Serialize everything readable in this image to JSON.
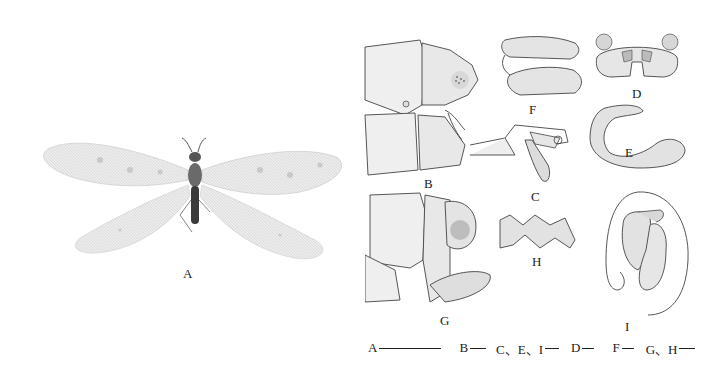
{
  "figure": {
    "panels": [
      {
        "id": "A",
        "label": "A",
        "description": "habitus, dorsal view (adult antlion with spread wings)"
      },
      {
        "id": "B",
        "label": "B",
        "description": "terminalia, lateral view"
      },
      {
        "id": "C",
        "label": "C",
        "description": "genital structure"
      },
      {
        "id": "D",
        "label": "D",
        "description": "structure, posterior view"
      },
      {
        "id": "E",
        "label": "E",
        "description": "curved genital structure"
      },
      {
        "id": "F",
        "label": "F",
        "description": "paired structures"
      },
      {
        "id": "G",
        "label": "G",
        "description": "terminalia, lateral view (female)"
      },
      {
        "id": "H",
        "label": "H",
        "description": "plate structure"
      },
      {
        "id": "I",
        "label": "I",
        "description": "spermatheca with duct"
      }
    ],
    "scale_bars": [
      {
        "label": "A",
        "length_px": 62
      },
      {
        "label": "B",
        "length_px": 16
      },
      {
        "label": "C、E、I",
        "length_px": 14
      },
      {
        "label": "D",
        "length_px": 12
      },
      {
        "label": "F",
        "length_px": 12
      },
      {
        "label": "G、H",
        "length_px": 16
      }
    ]
  }
}
